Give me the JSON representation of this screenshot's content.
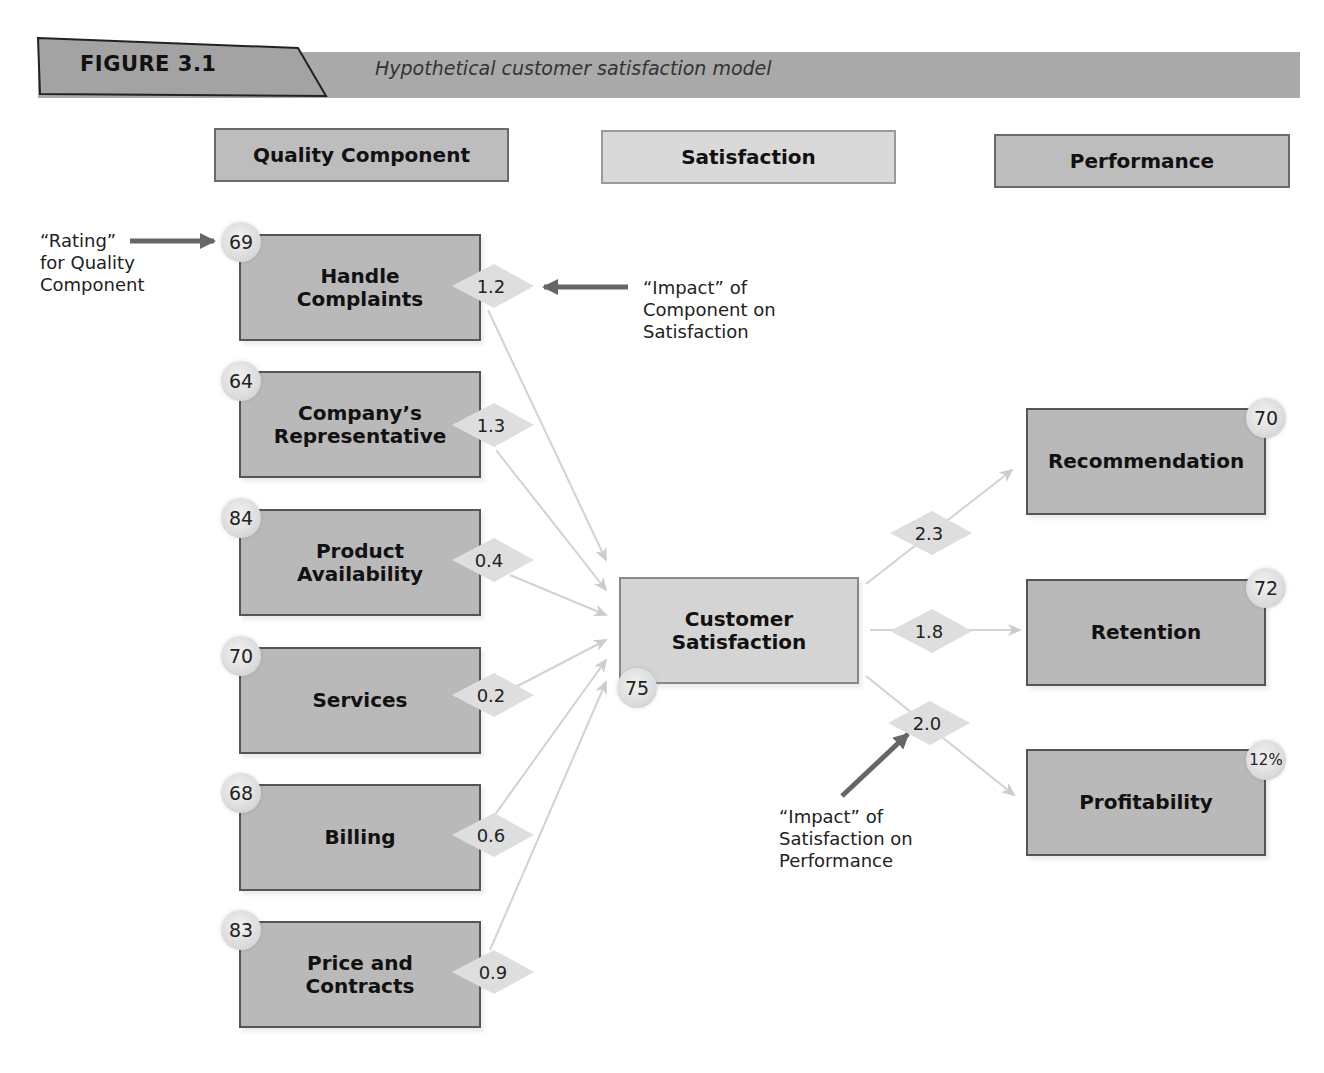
{
  "figure": {
    "label": "FIGURE 3.1",
    "caption": "Hypothetical customer satisfaction model"
  },
  "columns": {
    "quality": "Quality Component",
    "satisfaction": "Satisfaction",
    "performance": "Performance"
  },
  "quality_components": [
    {
      "line1": "Handle",
      "line2": "Complaints",
      "rating": "69",
      "impact": "1.2"
    },
    {
      "line1": "Company’s",
      "line2": "Representative",
      "rating": "64",
      "impact": "1.3"
    },
    {
      "line1": "Product",
      "line2": "Availability",
      "rating": "84",
      "impact": "0.4"
    },
    {
      "line1": "Services",
      "line2": "",
      "rating": "70",
      "impact": "0.2"
    },
    {
      "line1": "Billing",
      "line2": "",
      "rating": "68",
      "impact": "0.6"
    },
    {
      "line1": "Price and",
      "line2": "Contracts",
      "rating": "83",
      "impact": "0.9"
    }
  ],
  "satisfaction": {
    "line1": "Customer",
    "line2": "Satisfaction",
    "rating": "75"
  },
  "performance": [
    {
      "label": "Recommendation",
      "value": "70",
      "impact": "2.3"
    },
    {
      "label": "Retention",
      "value": "72",
      "impact": "1.8"
    },
    {
      "label": "Profitability",
      "value": "12%",
      "impact": "2.0"
    }
  ],
  "annotations": {
    "rating": {
      "line1": "“Rating”",
      "line2": "for Quality",
      "line3": "Component"
    },
    "impact_component": {
      "line1": "“Impact” of",
      "line2": "Component on",
      "line3": "Satisfaction"
    },
    "impact_satisfaction": {
      "line1": "“Impact” of",
      "line2": "Satisfaction on",
      "line3": "Performance"
    }
  },
  "colors": {
    "banner": "#a9a9a9",
    "box_dark": "#b9b9b9",
    "box_light": "#d4d4d4",
    "arrow_dark": "#666666",
    "connector": "#cfcfcf"
  }
}
